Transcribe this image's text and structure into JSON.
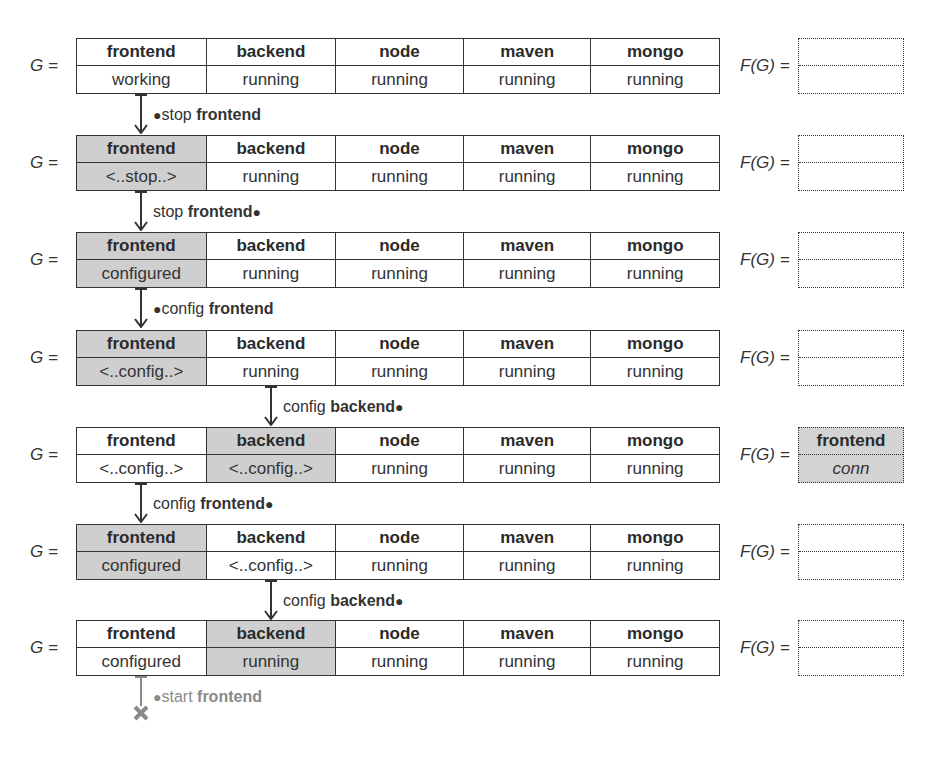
{
  "g_label": "G =",
  "fg_label": "F(G) =",
  "colors": {
    "highlight": "#cfcfcf",
    "line": "#333333",
    "failed": "#8a8a8a"
  },
  "states": [
    {
      "components": [
        {
          "name": "frontend",
          "state": "working",
          "highlight": false
        },
        {
          "name": "backend",
          "state": "running",
          "highlight": false
        },
        {
          "name": "node",
          "state": "running",
          "highlight": false
        },
        {
          "name": "maven",
          "state": "running",
          "highlight": false
        },
        {
          "name": "mongo",
          "state": "running",
          "highlight": false
        }
      ],
      "fault": {
        "name": "",
        "state": "",
        "highlight": false
      }
    },
    {
      "components": [
        {
          "name": "frontend",
          "state": "<..stop..>",
          "highlight": true
        },
        {
          "name": "backend",
          "state": "running",
          "highlight": false
        },
        {
          "name": "node",
          "state": "running",
          "highlight": false
        },
        {
          "name": "maven",
          "state": "running",
          "highlight": false
        },
        {
          "name": "mongo",
          "state": "running",
          "highlight": false
        }
      ],
      "fault": {
        "name": "",
        "state": "",
        "highlight": false
      }
    },
    {
      "components": [
        {
          "name": "frontend",
          "state": "configured",
          "highlight": true
        },
        {
          "name": "backend",
          "state": "running",
          "highlight": false
        },
        {
          "name": "node",
          "state": "running",
          "highlight": false
        },
        {
          "name": "maven",
          "state": "running",
          "highlight": false
        },
        {
          "name": "mongo",
          "state": "running",
          "highlight": false
        }
      ],
      "fault": {
        "name": "",
        "state": "",
        "highlight": false
      }
    },
    {
      "components": [
        {
          "name": "frontend",
          "state": "<..config..>",
          "highlight": true
        },
        {
          "name": "backend",
          "state": "running",
          "highlight": false
        },
        {
          "name": "node",
          "state": "running",
          "highlight": false
        },
        {
          "name": "maven",
          "state": "running",
          "highlight": false
        },
        {
          "name": "mongo",
          "state": "running",
          "highlight": false
        }
      ],
      "fault": {
        "name": "",
        "state": "",
        "highlight": false
      }
    },
    {
      "components": [
        {
          "name": "frontend",
          "state": "<..config..>",
          "highlight": false
        },
        {
          "name": "backend",
          "state": "<..config..>",
          "highlight": true
        },
        {
          "name": "node",
          "state": "running",
          "highlight": false
        },
        {
          "name": "maven",
          "state": "running",
          "highlight": false
        },
        {
          "name": "mongo",
          "state": "running",
          "highlight": false
        }
      ],
      "fault": {
        "name": "frontend",
        "state": "conn",
        "highlight": true
      }
    },
    {
      "components": [
        {
          "name": "frontend",
          "state": "configured",
          "highlight": true
        },
        {
          "name": "backend",
          "state": "<..config..>",
          "highlight": false
        },
        {
          "name": "node",
          "state": "running",
          "highlight": false
        },
        {
          "name": "maven",
          "state": "running",
          "highlight": false
        },
        {
          "name": "mongo",
          "state": "running",
          "highlight": false
        }
      ],
      "fault": {
        "name": "",
        "state": "",
        "highlight": false
      }
    },
    {
      "components": [
        {
          "name": "frontend",
          "state": "configured",
          "highlight": false
        },
        {
          "name": "backend",
          "state": "running",
          "highlight": true
        },
        {
          "name": "node",
          "state": "running",
          "highlight": false
        },
        {
          "name": "maven",
          "state": "running",
          "highlight": false
        },
        {
          "name": "mongo",
          "state": "running",
          "highlight": false
        }
      ],
      "fault": {
        "name": "",
        "state": "",
        "highlight": false
      }
    }
  ],
  "transitions": [
    {
      "dot_before": "●",
      "action": "stop",
      "target": "frontend",
      "dot_after": "",
      "column": 0
    },
    {
      "dot_before": "",
      "action": "stop",
      "target": "frontend",
      "dot_after": "●",
      "column": 0
    },
    {
      "dot_before": "●",
      "action": "config",
      "target": "frontend",
      "dot_after": "",
      "column": 0
    },
    {
      "dot_before": "",
      "action": "config",
      "target": "backend",
      "dot_after": "●",
      "column": 1
    },
    {
      "dot_before": "",
      "action": "config",
      "target": "frontend",
      "dot_after": "●",
      "column": 0
    },
    {
      "dot_before": "",
      "action": "config",
      "target": "backend",
      "dot_after": "●",
      "column": 1
    },
    {
      "dot_before": "●",
      "action": "start",
      "target": "frontend",
      "dot_after": "",
      "column": 0,
      "failed": true,
      "end_icon": "✖"
    }
  ]
}
